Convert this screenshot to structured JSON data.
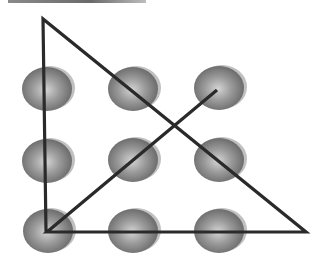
{
  "figure": {
    "colors": {
      "background": "#ffffff",
      "dot_light": "#d4d4d4",
      "dot_mid": "#9a9a9a",
      "dot_dark": "#5e5e5e",
      "line": "#2a2a2a",
      "top_bar": "#7a7a7a"
    },
    "dots": [
      {
        "row": 0,
        "col": 0,
        "cx": 47,
        "cy": 89
      },
      {
        "row": 0,
        "col": 1,
        "cx": 133,
        "cy": 89
      },
      {
        "row": 0,
        "col": 2,
        "cx": 219,
        "cy": 88
      },
      {
        "row": 1,
        "col": 0,
        "cx": 47,
        "cy": 161
      },
      {
        "row": 1,
        "col": 1,
        "cx": 133,
        "cy": 160
      },
      {
        "row": 1,
        "col": 2,
        "cx": 219,
        "cy": 160
      },
      {
        "row": 2,
        "col": 0,
        "cx": 48,
        "cy": 231
      },
      {
        "row": 2,
        "col": 1,
        "cx": 133,
        "cy": 231
      },
      {
        "row": 2,
        "col": 2,
        "cx": 219,
        "cy": 231
      }
    ],
    "path_points": [
      {
        "x": 217,
        "y": 90
      },
      {
        "x": 47,
        "y": 232
      },
      {
        "x": 306,
        "y": 232
      },
      {
        "x": 43,
        "y": 19
      },
      {
        "x": 46,
        "y": 232
      }
    ]
  }
}
